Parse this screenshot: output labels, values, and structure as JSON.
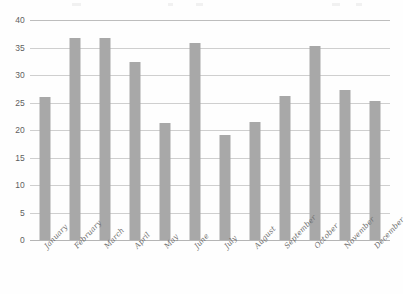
{
  "chart_data": {
    "type": "bar",
    "title": "",
    "subtitle": "",
    "xlabel": "",
    "ylabel": "",
    "categories": [
      "January",
      "February",
      "March",
      "April",
      "May",
      "June",
      "July",
      "August",
      "September",
      "October",
      "November",
      "December"
    ],
    "values": [
      26.0,
      36.8,
      36.8,
      32.3,
      21.3,
      35.8,
      19.1,
      21.4,
      26.1,
      35.2,
      27.3,
      25.3
    ],
    "ylim": [
      0,
      40
    ],
    "ytick_labels": [
      "0",
      "5",
      "10",
      "15",
      "20",
      "25",
      "30",
      "35",
      "40"
    ],
    "ytick_values": [
      0,
      5,
      10,
      15,
      20,
      25,
      30,
      35,
      40
    ],
    "grid": true,
    "legend": false,
    "legend_position": "none",
    "annotations": [],
    "series": [
      {
        "name": "",
        "values": [
          26.0,
          36.8,
          36.8,
          32.3,
          21.3,
          35.8,
          19.1,
          21.4,
          26.1,
          35.2,
          27.3,
          25.3
        ]
      }
    ]
  },
  "colors": {
    "bar_fill": "#a8a8a8",
    "gridline": "#cfcfcf",
    "top_gridline": "#bdbdbd",
    "baseline": "#b5b5b5",
    "tick_text": "#5e5e5e",
    "category_text": "#707070",
    "background": "#fefefe"
  }
}
